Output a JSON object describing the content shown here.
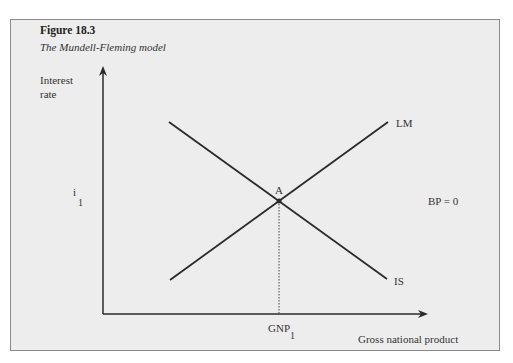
{
  "figure": {
    "number": "Figure 18.3",
    "title": "The Mundell-Fleming model"
  },
  "axes": {
    "y_label_line1": "Interest",
    "y_label_line2": "rate",
    "x_label": "Gross national product"
  },
  "labels": {
    "i_main": "i",
    "i_sub": "1",
    "gnp_main": "GNP",
    "gnp_sub": "1",
    "point": "A",
    "lm": "LM",
    "is": "IS",
    "bp": "BP = 0"
  },
  "colors": {
    "background": "#ededed",
    "line": "#2a2a2a"
  }
}
